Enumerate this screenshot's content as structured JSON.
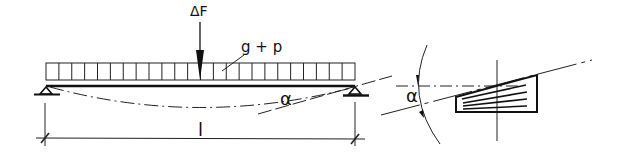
{
  "diagram": {
    "type": "structural-beam-deflection",
    "labels": {
      "point_load": "ΔF",
      "distributed_load": "g + p",
      "rotation_angle_beam": "α",
      "span_length": "l",
      "rotation_angle_detail": "α"
    },
    "colors": {
      "ink": "#111111",
      "background": "#ffffff"
    },
    "load_block": {
      "cells": 24
    },
    "detail_hatch_lines": 4
  }
}
